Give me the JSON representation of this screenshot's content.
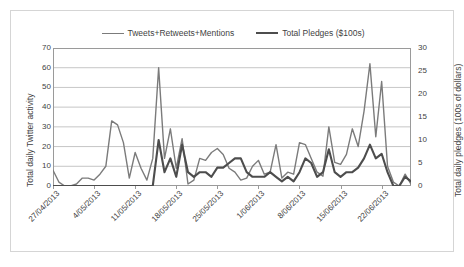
{
  "chart_data": {
    "type": "line",
    "title": "",
    "xlabel": "",
    "ylabel": "Total daily Twitter activity",
    "y2label": "Total daily pledges (100s of dollars)",
    "ylim": [
      0,
      70
    ],
    "y2lim": [
      0,
      30
    ],
    "yticks": [
      0,
      10,
      20,
      30,
      40,
      50,
      60,
      70
    ],
    "y2ticks": [
      0,
      5,
      10,
      15,
      20,
      25,
      30
    ],
    "grid": true,
    "legend_position": "top-center",
    "x_tick_labels": [
      "27/04/2013",
      "4/05/2013",
      "11/05/2013",
      "18/05/2013",
      "25/05/2013",
      "1/06/2013",
      "8/06/2013",
      "15/06/2013",
      "22/06/2013"
    ],
    "x_tick_indices": [
      0,
      7,
      14,
      21,
      28,
      35,
      42,
      49,
      56
    ],
    "n_points": 62,
    "series": [
      {
        "name": "Tweets+Retweets+Mentions",
        "axis": "left",
        "color": "#7b7b7b",
        "width": 1.4,
        "values": [
          8,
          2,
          0,
          0,
          1,
          4,
          4,
          3,
          6,
          10,
          33,
          31,
          22,
          4,
          17,
          9,
          3,
          14,
          60,
          14,
          29,
          9,
          24,
          1,
          3,
          14,
          13,
          17,
          19,
          16,
          9,
          7,
          3,
          4,
          10,
          13,
          6,
          7,
          21,
          4,
          7,
          6,
          22,
          21,
          14,
          7,
          5,
          30,
          12,
          11,
          16,
          29,
          20,
          38,
          62,
          25,
          53,
          10,
          2,
          0,
          6,
          1
        ]
      },
      {
        "name": "Total Pledges ($100s)",
        "axis": "right",
        "color": "#4d4d4d",
        "width": 2.1,
        "values": [
          0,
          0,
          0,
          0,
          0,
          0,
          0,
          0,
          0,
          0,
          0,
          0,
          0,
          0,
          0,
          0,
          0,
          0,
          10,
          3,
          6,
          2,
          9,
          3,
          2,
          3,
          3,
          2,
          4,
          4,
          5,
          6,
          6,
          3,
          2,
          2,
          2,
          3,
          2,
          1,
          2,
          1,
          3,
          6,
          5,
          2,
          3,
          8,
          3,
          2,
          3,
          3,
          4,
          6,
          9,
          6,
          7,
          3,
          0,
          0,
          2,
          1
        ]
      }
    ]
  },
  "legend": {
    "entries": [
      {
        "label": "Tweets+Retweets+Mentions"
      },
      {
        "label": "Total Pledges ($100s)"
      }
    ]
  }
}
